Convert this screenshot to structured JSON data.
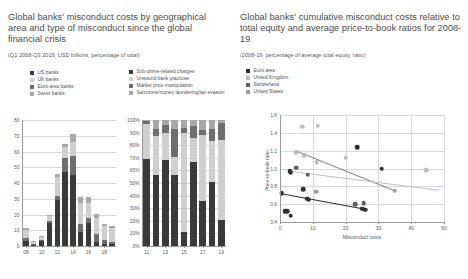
{
  "left_panel": {
    "title": "Global banks' misconduct costs by geographical area and type of misconduct since the global financial crisis",
    "subtitle": "(Q1 2008-Q3 2019, USD billions, percentage of total)",
    "legend_geo": [
      {
        "label": "US banks",
        "color": "#3a3a3a"
      },
      {
        "label": "UK banks",
        "color": "#cfcfcf"
      },
      {
        "label": "Euro area banks",
        "color": "#6e6e6e"
      },
      {
        "label": "Swiss banks",
        "color": "#a8a8a8"
      }
    ],
    "legend_type": [
      {
        "label": "Sub-prime-related charges",
        "color": "#3a3a3a"
      },
      {
        "label": "Unsound bank practices",
        "color": "#cfcfcf"
      },
      {
        "label": "Market price manipulation",
        "color": "#6e6e6e"
      },
      {
        "label": "Sanctions/money laundering/tax evasion",
        "color": "#a8a8a8"
      }
    ]
  },
  "right_panel": {
    "title": "Global banks' cumulative misconduct costs relative to total equity and average price-to-book ratios for 2008-19",
    "subtitle": "(2008-19, percentage of average total equity, ratio)",
    "legend_country": [
      {
        "label": "Euro area",
        "color": "#2f2f2f"
      },
      {
        "label": "United Kingdom",
        "color": "#bdbdbd"
      },
      {
        "label": "Switzerland",
        "color": "#5e5e5e"
      },
      {
        "label": "United States",
        "color": "#9d9d9d"
      }
    ]
  },
  "chart_data": [
    {
      "type": "bar",
      "id": "misconduct-costs-by-area",
      "title": "Misconduct costs by geographical area",
      "xlabel": "",
      "ylabel": "",
      "ylim": [
        0,
        80
      ],
      "yticks": [
        0,
        10,
        20,
        30,
        40,
        50,
        60,
        70,
        80
      ],
      "categories": [
        "08",
        "09",
        "10",
        "11",
        "12",
        "13",
        "14",
        "15",
        "16",
        "17",
        "18",
        "19"
      ],
      "xtick_labels": [
        "08",
        "10",
        "12",
        "14",
        "16",
        "18"
      ],
      "series": [
        {
          "name": "US banks",
          "color": "#3a3a3a",
          "values": [
            3.0,
            1.0,
            3.0,
            14.5,
            29.5,
            47.0,
            45.0,
            9.0,
            14.5,
            2.5,
            1.5,
            1.0
          ]
        },
        {
          "name": "Euro area banks",
          "color": "#6e6e6e",
          "values": [
            2.0,
            0.5,
            1.0,
            1.5,
            2.0,
            9.0,
            12.0,
            5.0,
            3.5,
            5.0,
            2.5,
            1.5
          ]
        },
        {
          "name": "UK banks",
          "color": "#cfcfcf",
          "values": [
            5.0,
            1.0,
            2.0,
            3.5,
            12.0,
            7.0,
            9.0,
            13.0,
            9.0,
            10.0,
            9.0,
            9.0
          ]
        },
        {
          "name": "Swiss banks",
          "color": "#a8a8a8",
          "values": [
            1.5,
            0.5,
            0.5,
            0.5,
            2.0,
            2.0,
            5.0,
            4.0,
            4.0,
            3.0,
            1.0,
            1.0
          ]
        }
      ]
    },
    {
      "type": "bar",
      "id": "misconduct-costs-by-type",
      "title": "Misconduct costs by type of misconduct",
      "xlabel": "",
      "ylabel": "",
      "ylim": [
        0,
        100
      ],
      "yticks": [
        0,
        10,
        20,
        30,
        40,
        50,
        60,
        70,
        80,
        90,
        100
      ],
      "ytick_labels": [
        "0%",
        "10%",
        "20%",
        "30%",
        "40%",
        "50%",
        "60%",
        "70%",
        "80%",
        "90%",
        "100%"
      ],
      "categories": [
        "11",
        "12",
        "13",
        "14",
        "15",
        "16",
        "17",
        "18",
        "19"
      ],
      "xtick_labels": [
        "11",
        "13",
        "15",
        "17",
        "19"
      ],
      "stacked_percent": true,
      "series": [
        {
          "name": "Sub-prime-related charges",
          "color": "#3a3a3a",
          "values": [
            69,
            56,
            68,
            56,
            11,
            67,
            36,
            51,
            21
          ]
        },
        {
          "name": "Unsound bank practices",
          "color": "#cfcfcf",
          "values": [
            28,
            31,
            22,
            15,
            79,
            19,
            52,
            32,
            63
          ]
        },
        {
          "name": "Market price manipulation",
          "color": "#6e6e6e",
          "values": [
            2,
            6,
            6,
            22,
            4,
            9,
            4,
            10,
            14
          ]
        },
        {
          "name": "Sanctions/money laundering/tax evasion",
          "color": "#a8a8a8",
          "values": [
            1,
            7,
            4,
            7,
            6,
            5,
            8,
            7,
            2
          ]
        }
      ]
    },
    {
      "type": "scatter",
      "id": "misconduct-costs-vs-ptb",
      "title": "Cumulative misconduct costs vs price-to-book ratio",
      "xlabel": "Misconduct costs",
      "ylabel": "Price-to-book ratio",
      "xlim": [
        0,
        50
      ],
      "ylim": [
        0.4,
        1.6
      ],
      "xticks": [
        0,
        10,
        20,
        30,
        40,
        50
      ],
      "yticks": [
        0.4,
        0.6,
        0.8,
        1.0,
        1.2,
        1.4,
        1.6
      ],
      "ytick_labels": [
        "0.4",
        "0.6",
        "0.8",
        "1.0",
        "1.2",
        "1.4",
        "1.6"
      ],
      "series": [
        {
          "name": "Euro area",
          "color": "#2f2f2f",
          "points": [
            [
              0.5,
              0.72
            ],
            [
              1.6,
              0.52
            ],
            [
              2.2,
              0.52
            ],
            [
              3.3,
              0.47
            ],
            [
              3.0,
              0.97
            ],
            [
              3.3,
              0.96
            ],
            [
              7.0,
              0.77
            ],
            [
              8.3,
              0.66
            ],
            [
              8.8,
              0.65
            ],
            [
              25.0,
              0.55
            ],
            [
              26.0,
              0.54
            ],
            [
              31.0,
              1.0
            ],
            [
              23.5,
              1.24
            ]
          ]
        },
        {
          "name": "United Kingdom",
          "color": "#bdbdbd",
          "points": [
            [
              5.0,
              1.18
            ],
            [
              7.4,
              1.15
            ],
            [
              6.8,
              1.47
            ],
            [
              11.5,
              1.48
            ],
            [
              11.2,
              1.07
            ],
            [
              20.0,
              1.12
            ],
            [
              44.5,
              0.98
            ]
          ]
        },
        {
          "name": "Switzerland",
          "color": "#5e5e5e",
          "points": [
            [
              5.0,
              1.01
            ],
            [
              8.5,
              0.93
            ],
            [
              23.0,
              0.6
            ],
            [
              25.5,
              0.61
            ]
          ]
        },
        {
          "name": "United States",
          "color": "#9d9d9d",
          "points": [
            [
              11.0,
              0.74
            ],
            [
              35.0,
              0.75
            ]
          ]
        }
      ],
      "trendlines": [
        {
          "name": "trend-dark",
          "color": "#2f2f2f",
          "x0": 0.0,
          "y0": 0.725,
          "x1": 26.5,
          "y1": 0.545
        },
        {
          "name": "trend-mid",
          "color": "#8a8a8a",
          "x0": 4.5,
          "y0": 1.21,
          "x1": 35.0,
          "y1": 0.755
        },
        {
          "name": "trend-light",
          "color": "#c0c0c0",
          "x0": 3.5,
          "y0": 0.975,
          "x1": 48.5,
          "y1": 0.765
        }
      ]
    }
  ]
}
